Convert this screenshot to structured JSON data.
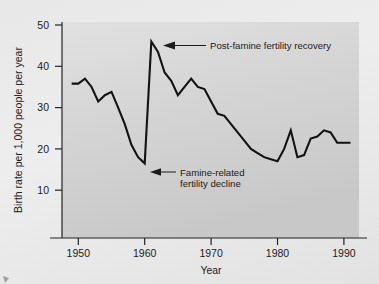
{
  "chart_data": {
    "type": "line",
    "title": "",
    "xlabel": "Year",
    "ylabel": "Birth rate per 1,000 people per year",
    "xlim": [
      1948,
      1992
    ],
    "ylim": [
      0,
      50
    ],
    "xticks": [
      1950,
      1960,
      1970,
      1980,
      1990
    ],
    "yticks": [
      10,
      20,
      30,
      40,
      50
    ],
    "xtick_labels": [
      "1950",
      "1960",
      "1970",
      "1980",
      "1990"
    ],
    "ytick_labels": [
      "10",
      "20",
      "30",
      "40",
      "50"
    ],
    "grid": false,
    "legend": "none",
    "series": [
      {
        "name": "Birth rate",
        "x": [
          1949,
          1950,
          1951,
          1952,
          1953,
          1954,
          1955,
          1956,
          1957,
          1958,
          1959,
          1960,
          1961,
          1962,
          1963,
          1964,
          1965,
          1966,
          1967,
          1968,
          1969,
          1970,
          1971,
          1972,
          1973,
          1974,
          1975,
          1976,
          1977,
          1978,
          1979,
          1980,
          1981,
          1982,
          1983,
          1984,
          1985,
          1986,
          1987,
          1988,
          1989,
          1990,
          1991
        ],
        "values": [
          35.8,
          35.8,
          37.0,
          35.0,
          31.5,
          33.0,
          33.8,
          30.0,
          26.0,
          21.0,
          18.0,
          16.5,
          46.0,
          43.5,
          38.5,
          36.5,
          33.0,
          35.0,
          37.0,
          35.0,
          34.5,
          31.5,
          28.5,
          28.0,
          26.0,
          24.0,
          22.0,
          20.0,
          19.0,
          18.0,
          17.5,
          17.0,
          20.0,
          24.5,
          18.0,
          18.5,
          22.5,
          23.0,
          24.5,
          24.0,
          21.5,
          21.5,
          21.5
        ]
      }
    ],
    "annotations": [
      {
        "id": "recovery",
        "text": "Post-famine fertility recovery",
        "point_x": 1961,
        "point_y": 46.0
      },
      {
        "id": "decline",
        "text_line1": "Famine-related",
        "text_line2": "fertility decline",
        "point_x": 1960,
        "point_y": 16.5
      }
    ],
    "colors": {
      "line": "#111111",
      "axis": "#222222",
      "text": "#1a1a1a",
      "plot_background": "#d7d7d7",
      "figure_background": "#ececec"
    }
  }
}
